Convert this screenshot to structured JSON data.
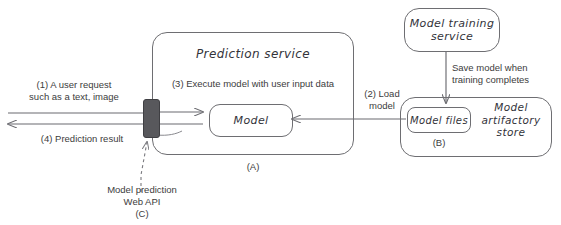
{
  "diagram": {
    "title_absent": true,
    "prediction_service": {
      "title": "Prediction service",
      "caption": "(A)",
      "step3": "(3) Execute model with user input data",
      "model_box": "Model"
    },
    "web_api": {
      "label": "Model prediction\nWeb API",
      "caption": "(C)",
      "node_name": "web-api-node"
    },
    "flows": {
      "step1": "(1) A user request\nsuch as a text, image",
      "step4": "(4) Prediction result",
      "step2": "(2) Load\nmodel",
      "save_model": "Save model when\ntraining completes"
    },
    "training_service": {
      "title": "Model training\nservice"
    },
    "artifactory_store": {
      "title": "Model\nartifactory\nstore",
      "files_box": "Model files",
      "caption": "(B)"
    },
    "colors": {
      "stroke": "#6e6e72",
      "arrow": "#6b6b70",
      "text": "#3c3c3c",
      "hand_text": "#33333a",
      "webapi_fill": "#58585c",
      "background": "#ffffff"
    }
  }
}
